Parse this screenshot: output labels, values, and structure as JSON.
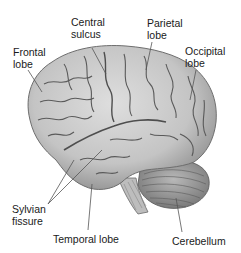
{
  "diagram": {
    "labels": {
      "frontal_lobe": "Frontal\nlobe",
      "central_sulcus": "Central\nsulcus",
      "parietal_lobe": "Parietal\nlobe",
      "occipital_lobe": "Occipital\nlobe",
      "sylvian_fissure": "Sylvian\nfissure",
      "temporal_lobe": "Temporal lobe",
      "cerebellum": "Cerebellum"
    },
    "colors": {
      "brain_fill": "#c9c9c9",
      "brain_shadow": "#8a8a8a",
      "sulci": "#5a5a5a",
      "leader_lines": "#555555",
      "text": "#1a1a1a"
    }
  }
}
